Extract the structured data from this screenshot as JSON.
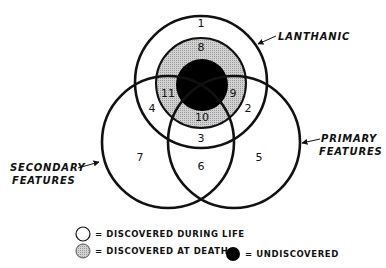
{
  "diagram": {
    "type": "venn",
    "sets": [
      {
        "id": "lanthanic",
        "label": "LANTHANIC"
      },
      {
        "id": "primary",
        "label_line1": "PRIMARY",
        "label_line2": "FEATURES"
      },
      {
        "id": "secondary",
        "label_line1": "SECONDARY",
        "label_line2": "FEATURES"
      }
    ],
    "regions": [
      "1",
      "2",
      "3",
      "4",
      "5",
      "6",
      "7",
      "8",
      "9",
      "10",
      "11"
    ],
    "legend": [
      {
        "symbol": "white-circle",
        "text": "= DISCOVERED DURING LIFE"
      },
      {
        "symbol": "grey-circle",
        "text": "= DISCOVERED AT DEATH"
      },
      {
        "symbol": "black-circle",
        "text": "= UNDISCOVERED"
      }
    ],
    "colors": {
      "stroke": "#111111",
      "discovered_during_life": "#ffffff",
      "discovered_at_death": "#c4c4c4",
      "undiscovered": "#000000"
    }
  }
}
